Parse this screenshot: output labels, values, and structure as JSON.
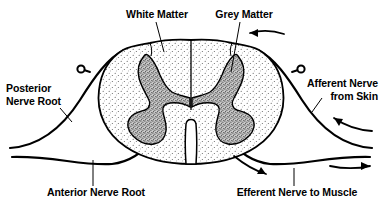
{
  "figure": {
    "background_color": "#ffffff",
    "ink_color": "#000000",
    "white_matter_fill": "#fdfdfd",
    "grey_matter_fill": "#9a9a9a"
  },
  "labels": {
    "white_matter": "White Matter",
    "grey_matter": "Grey Matter",
    "posterior_nerve_root_line1": "Posterior",
    "posterior_nerve_root_line2": "Nerve Root",
    "afferent_nerve_line1": "Afferent Nerve",
    "afferent_nerve_line2": "from Skin",
    "anterior_nerve_root": "Anterior Nerve Root",
    "efferent_nerve": "Efferent Nerve to Muscle"
  },
  "structures": {
    "cord": "spinal-cord-cross-section",
    "white_matter_region": "white-matter",
    "grey_matter_left_horn": "grey-matter-left-horn",
    "grey_matter_right_horn": "grey-matter-right-horn",
    "anterior_median_fissure": "anterior-median-fissure",
    "posterior_median_septum": "posterior-median-septum",
    "dorsal_root_ganglion_left": "dorsal-root-ganglion-left",
    "dorsal_root_ganglion_right": "dorsal-root-ganglion-right"
  },
  "arrows": [
    {
      "name": "afferent-inflow-top-right",
      "direction": "left",
      "meaning": "sensory signal travelling into the cord"
    },
    {
      "name": "afferent-inflow-lower-right",
      "direction": "left",
      "meaning": "sensory signal from skin travelling toward cord"
    },
    {
      "name": "efferent-outflow-right",
      "direction": "right",
      "meaning": "motor signal travelling out to muscle"
    },
    {
      "name": "efferent-outflow-bottom",
      "direction": "down-right",
      "meaning": "motor signal leaving the cord"
    }
  ]
}
